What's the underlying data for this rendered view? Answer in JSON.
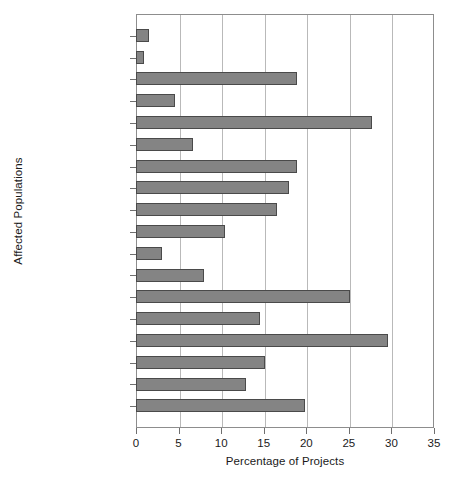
{
  "chart_data": {
    "type": "bar",
    "orientation": "horizontal",
    "title": "",
    "xlabel": "Percentage of Projects",
    "ylabel": "Affected Populations",
    "xlim": [
      0,
      35
    ],
    "xticks": [
      0,
      5,
      10,
      15,
      20,
      25,
      30,
      35
    ],
    "grid": "vertical",
    "legend": "none",
    "bar_color": "#848484",
    "bar_edge_color": "#4a4a4a",
    "categories": [
      "Health research",
      "Other",
      "Other company",
      "Police",
      "Schools",
      "Worksites",
      "Educators",
      "General",
      "Other health",
      "Military",
      "Emergency",
      "Homecare",
      "Medical",
      "Diagnostics",
      "Research",
      "Hospitals",
      "Inpatients",
      "Outpatients"
    ],
    "values": [
      1.5,
      0.9,
      18.9,
      4.6,
      27.7,
      6.7,
      18.9,
      18.0,
      16.6,
      10.5,
      3.1,
      8.0,
      25.1,
      14.6,
      29.6,
      15.2,
      12.9,
      19.8
    ]
  }
}
